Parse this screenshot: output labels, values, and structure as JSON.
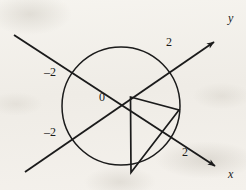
{
  "figure": {
    "stroke_color": "#1b1b1b",
    "background_color": "#f3f1ec"
  },
  "axes": {
    "x_axis": {
      "label": "x",
      "direction": "down-right",
      "arrow": "arrowhead-x"
    },
    "y_axis": {
      "label": "y",
      "direction": "up-right",
      "arrow": "arrowhead-y"
    }
  },
  "origin": {
    "label": "0"
  },
  "ticks": [
    {
      "label": "2",
      "axis": "y",
      "side": "positive"
    },
    {
      "label": "–2",
      "axis": "y",
      "side": "negative"
    },
    {
      "label": "2",
      "axis": "x",
      "side": "positive"
    },
    {
      "label": "–2",
      "axis": "x",
      "side": "negative"
    }
  ],
  "circle": {
    "radius_label": "2",
    "center_label": "0"
  },
  "triangle": {
    "description": "right triangle inscribed in lower-right of circle"
  }
}
